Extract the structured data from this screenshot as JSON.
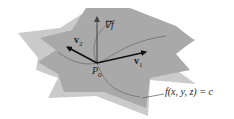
{
  "figure": {
    "labels": {
      "gradient": "∇f",
      "v1_letter": "v",
      "v1_sub": "1",
      "v2_letter": "v",
      "v2_sub": "2",
      "point_letter": "P",
      "point_sub": "0",
      "surface_equation": "f(x, y, z) = c"
    },
    "colors": {
      "tangent_plane": "#a9a9a9",
      "level_surface": "#c9c9c9",
      "curve": "#6f6f6f",
      "arrow": "#111111"
    }
  }
}
